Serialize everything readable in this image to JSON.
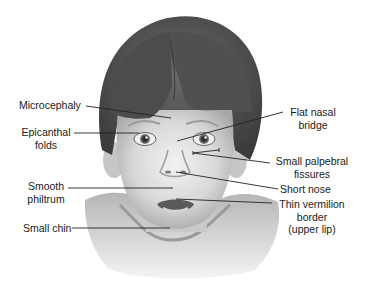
{
  "figure": {
    "labels_left": [
      {
        "id": "microcephaly",
        "lines": [
          "Microcephaly"
        ]
      },
      {
        "id": "epicanthal-folds",
        "lines": [
          "Epicanthal",
          "folds"
        ]
      },
      {
        "id": "smooth-philtrum",
        "lines": [
          "Smooth",
          "philtrum"
        ]
      },
      {
        "id": "small-chin",
        "lines": [
          "Small chin"
        ]
      }
    ],
    "labels_right": [
      {
        "id": "flat-nasal-bridge",
        "lines": [
          "Flat nasal",
          "bridge"
        ]
      },
      {
        "id": "small-palpebral-fissures",
        "lines": [
          "Small palpebral",
          "fissures"
        ]
      },
      {
        "id": "short-nose",
        "lines": [
          "Short nose"
        ]
      },
      {
        "id": "thin-vermilion-border",
        "lines": [
          "Thin vermilion",
          "border",
          "(upper lip)"
        ]
      }
    ],
    "colors": {
      "background": "#ffffff",
      "hair": "#4a4a4a",
      "skin": "#d9d9d9",
      "leader_line": "#222222",
      "text": "#1a1a1a"
    }
  }
}
